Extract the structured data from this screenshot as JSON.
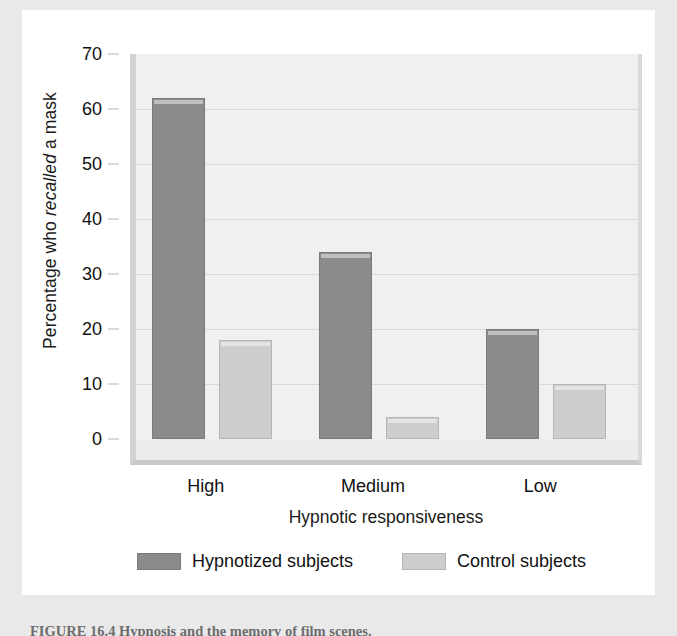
{
  "figure": {
    "caption": "FIGURE 16.4   Hypnosis and the memory of film scenes."
  },
  "axes": {
    "y_label_prefix": "Percentage who ",
    "y_label_italic": "recalled",
    "y_label_suffix": " a mask",
    "y_label_full": "Percentage who recalled a mask",
    "x_label": "Hypnotic responsiveness"
  },
  "legend": {
    "items": [
      {
        "label": "Hypnotized subjects",
        "color": "#8b8b8b",
        "swatch": "dark"
      },
      {
        "label": "Control subjects",
        "color": "#cdcdcd",
        "swatch": "light"
      }
    ]
  },
  "chart_data": {
    "type": "bar",
    "title": "",
    "xlabel": "Hypnotic responsiveness",
    "ylabel": "Percentage who recalled a mask",
    "categories": [
      "High",
      "Medium",
      "Low"
    ],
    "series": [
      {
        "name": "Hypnotized subjects",
        "color": "#8b8b8b",
        "values": [
          62,
          34,
          20
        ]
      },
      {
        "name": "Control subjects",
        "color": "#cdcdcd",
        "values": [
          18,
          4,
          10
        ]
      }
    ],
    "ylim": [
      0,
      70
    ],
    "yticks": [
      0,
      10,
      20,
      30,
      40,
      50,
      60,
      70
    ],
    "ytick_labels": [
      "0",
      "10",
      "20",
      "30",
      "40",
      "50",
      "60",
      "70"
    ],
    "grid": true,
    "grid_axis": "y",
    "legend_position": "bottom",
    "plot_background": "#f0f0f0",
    "figure_background": "#ffffff",
    "page_background": "#e9e9e9"
  }
}
